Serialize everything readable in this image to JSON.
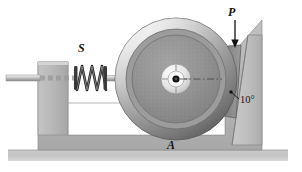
{
  "figure": {
    "background_color": "#ffffff"
  },
  "labels": {
    "spring": "S",
    "force": "P",
    "base": "A",
    "angle": "10°"
  },
  "parts": {
    "wheel": {
      "name": "brake-disk-wheel",
      "center_x": 176,
      "center_y": 79,
      "outer_radius": 61,
      "rim_inner_radius": 50,
      "disk_radius": 44,
      "hub_outer_radius": 15,
      "hub_inner_radius": 8,
      "axle_radius": 3,
      "rim_color": "#d7d7d7",
      "disk_color": "#8e8e8e",
      "hub_color": "#e2e2e2",
      "axle_color": "#1a1a1a"
    },
    "spring": {
      "name": "compression-spring",
      "coils": 7,
      "x_start": 76,
      "x_end": 107,
      "color": "#2b2b2b"
    },
    "left_support": {
      "name": "left-support-block",
      "x": 38,
      "y": 62,
      "width": 30,
      "height": 73,
      "color": "#b5b5b5"
    },
    "right_wall": {
      "name": "angled-right-wall",
      "tilt_degrees": 10,
      "color": "#bdbdbd"
    },
    "brake_pad": {
      "name": "brake-pad-block",
      "color": "#8f8f8f"
    },
    "base_frame": {
      "name": "base-frame",
      "color": "#b7b7b7",
      "cutout_color": "#ffffff"
    },
    "ground": {
      "name": "ground-strip",
      "color": "#c3c3c3"
    },
    "shaft": {
      "name": "axle-shaft",
      "color": "#c9c9c9"
    },
    "force_arrow": {
      "name": "force-arrow-p",
      "direction": "down",
      "color": "#1a1a1a"
    },
    "centerline": {
      "name": "axis-centerline",
      "style": "dash-dot",
      "color": "#3a3a3a"
    },
    "leader_line": {
      "name": "angle-leader-line",
      "color": "#1a1a1a"
    }
  }
}
